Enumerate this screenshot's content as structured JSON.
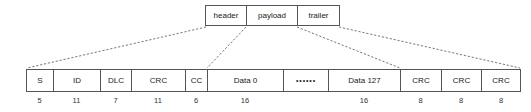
{
  "diagram": {
    "background_color": "#ffffff",
    "line_color": "#555555",
    "text_color": "#1a1a1a",
    "frame_groups": [
      {
        "label": "header",
        "width": 41
      },
      {
        "label": "payload",
        "width": 51
      },
      {
        "label": "trailer",
        "width": 43
      }
    ],
    "fields": [
      {
        "label": "S",
        "bits": "5",
        "width": 27
      },
      {
        "label": "ID",
        "bits": "11",
        "width": 47
      },
      {
        "label": "DLC",
        "bits": "7",
        "width": 31
      },
      {
        "label": "CRC",
        "bits": "11",
        "width": 54
      },
      {
        "label": "CC",
        "bits": "6",
        "width": 22
      },
      {
        "label": "Data 0",
        "bits": "16",
        "width": 76
      },
      {
        "label": "••••••",
        "bits": "",
        "width": 45
      },
      {
        "label": "Data 127",
        "bits": "16",
        "width": 72
      },
      {
        "label": "CRC",
        "bits": "8",
        "width": 41
      },
      {
        "label": "CRC",
        "bits": "8",
        "width": 40
      },
      {
        "label": "CRC",
        "bits": "8",
        "width": 40
      }
    ],
    "connectors": [
      {
        "name": "header-left",
        "x1": 206,
        "y1": 27,
        "x2": 27,
        "y2": 68
      },
      {
        "name": "header-right",
        "x1": 246,
        "y1": 27,
        "x2": 207,
        "y2": 68
      },
      {
        "name": "trailer-left",
        "x1": 297,
        "y1": 27,
        "x2": 400,
        "y2": 68
      },
      {
        "name": "trailer-right",
        "x1": 339,
        "y1": 27,
        "x2": 520,
        "y2": 68
      }
    ]
  }
}
